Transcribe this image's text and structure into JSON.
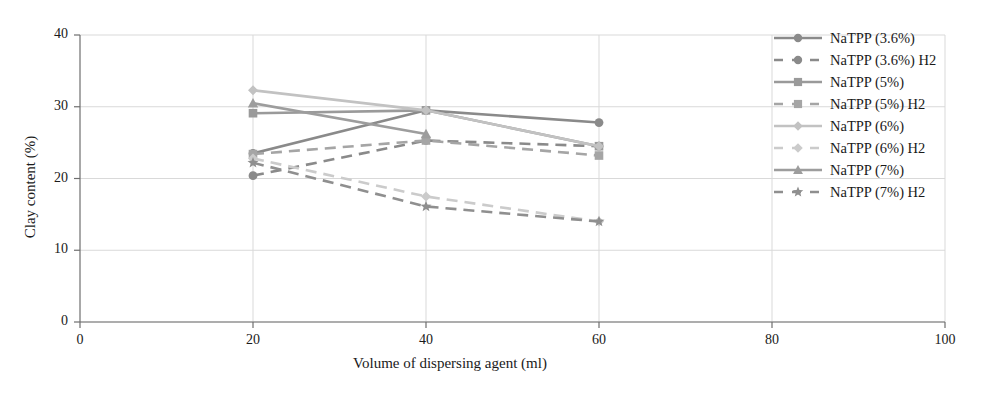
{
  "chart_data": {
    "type": "line",
    "title": "",
    "subtitle": "",
    "xlabel": "Volume of dispersing agent (ml)",
    "ylabel": "Clay content (%)",
    "x": [
      20,
      40,
      60
    ],
    "xlim": [
      0,
      100
    ],
    "ylim": [
      0,
      40
    ],
    "xticks": [
      "0",
      "20",
      "40",
      "60",
      "80",
      "100"
    ],
    "xtick_values": [
      0,
      20,
      40,
      60,
      80,
      100
    ],
    "yticks": [
      "0",
      "10",
      "20",
      "30",
      "40"
    ],
    "ytick_values": [
      0,
      10,
      20,
      30,
      40
    ],
    "grid": "horizontal-and-vertical-light",
    "legend_position": "right-inside-top",
    "series": [
      {
        "name": "NaTPP (3.6%)",
        "values": [
          23.5,
          29.5,
          27.8
        ],
        "marker": "circle",
        "dash": "solid",
        "color": "#8a8a8a"
      },
      {
        "name": "NaTPP (3.6%) H2",
        "values": [
          20.4,
          25.3,
          24.5
        ],
        "marker": "circle",
        "dash": "dashed",
        "color": "#8a8a8a"
      },
      {
        "name": "NaTPP (5%)",
        "values": [
          29.1,
          29.5,
          24.5
        ],
        "marker": "square",
        "dash": "solid",
        "color": "#9a9a9a"
      },
      {
        "name": "NaTPP (5%) H2",
        "values": [
          23.4,
          25.3,
          23.2
        ],
        "marker": "square",
        "dash": "dashed",
        "color": "#a5a5a5"
      },
      {
        "name": "NaTPP (6%)",
        "values": [
          32.3,
          29.5,
          24.5
        ],
        "marker": "diamond",
        "dash": "solid",
        "color": "#c2c2c2"
      },
      {
        "name": "NaTPP (6%) H2",
        "values": [
          22.8,
          17.5,
          14.0
        ],
        "marker": "diamond",
        "dash": "dashed",
        "color": "#cbcbcb"
      },
      {
        "name": "NaTPP (7%)",
        "values": [
          30.5,
          26.2,
          null
        ],
        "marker": "triangle",
        "dash": "solid",
        "color": "#9d9d9d"
      },
      {
        "name": "NaTPP (7%) H2",
        "values": [
          22.2,
          16.1,
          14.0
        ],
        "marker": "star",
        "dash": "dashed",
        "color": "#8f8f8f"
      }
    ]
  },
  "axes": {
    "y_title": "Clay content (%)",
    "x_title": "Volume of dispersing agent (ml)"
  },
  "legend": {
    "entries": [
      {
        "label": "NaTPP (3.6%)"
      },
      {
        "label": "NaTPP (3.6%) H2"
      },
      {
        "label": "NaTPP (5%)"
      },
      {
        "label": "NaTPP (5%) H2"
      },
      {
        "label": "NaTPP (6%)"
      },
      {
        "label": "NaTPP (6%) H2"
      },
      {
        "label": "NaTPP (7%)"
      },
      {
        "label": "NaTPP (7%) H2"
      }
    ]
  },
  "colors": {
    "axis": "#6e6e6e",
    "grid": "#d9d9d9",
    "text": "#1a1a1a",
    "background": "#ffffff"
  }
}
